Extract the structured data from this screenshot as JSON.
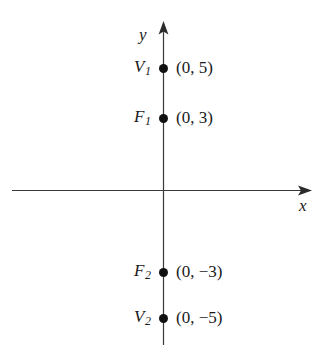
{
  "figure": {
    "width": 319,
    "height": 358,
    "background": "#ffffff",
    "ink_color": "#1a1a1a"
  },
  "axes": {
    "x_axis": {
      "label": "x",
      "y_pixel": 190,
      "x_start": 12,
      "x_end": 312,
      "arrow_end": "right"
    },
    "y_axis": {
      "label": "y",
      "x_pixel": 163,
      "y_start": 22,
      "y_end": 345,
      "arrow_end": "top"
    },
    "origin": {
      "x": 163,
      "y": 190
    }
  },
  "chart_data": {
    "type": "scatter",
    "title": "",
    "xlabel": "x",
    "ylabel": "y",
    "grid": false,
    "legend": "none",
    "axis_arrows": {
      "x": "right",
      "y": "up"
    },
    "points": [
      {
        "name": "V",
        "subscript": "1",
        "label": "V1",
        "coord_text": "(0, 5)",
        "x": 0,
        "y": 5,
        "px": 163,
        "py": 68
      },
      {
        "name": "F",
        "subscript": "1",
        "label": "F1",
        "coord_text": "(0, 3)",
        "x": 0,
        "y": 3,
        "px": 163,
        "py": 118
      },
      {
        "name": "F",
        "subscript": "2",
        "label": "F2",
        "coord_text": "(0, −3)",
        "x": 0,
        "y": -3,
        "px": 163,
        "py": 272
      },
      {
        "name": "V",
        "subscript": "2",
        "label": "V2",
        "coord_text": "(0, −5)",
        "x": 0,
        "y": -5,
        "px": 163,
        "py": 318
      }
    ]
  }
}
